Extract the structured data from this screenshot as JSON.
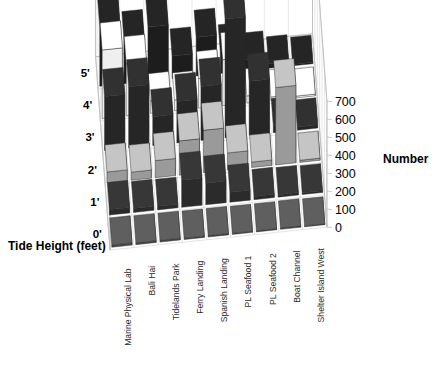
{
  "title": {
    "text": "Number by Site",
    "clipped_at_top": true
  },
  "axes": {
    "value_axis": {
      "label": "Number",
      "ticks": [
        0,
        100,
        200,
        300,
        400,
        500,
        600,
        700
      ],
      "min": 0,
      "max": 700
    },
    "depth_axis": {
      "label": "Tide Height (feet)",
      "categories": [
        "0'",
        "1'",
        "2'",
        "3'",
        "4'",
        "5'"
      ]
    },
    "category_axis": {
      "categories": [
        "Marine Physical Lab",
        "Bali Hai",
        "Tidelands Park",
        "Ferry Landing",
        "Spanish Landing",
        "PL Seafood 1",
        "PL Seafood 2",
        "Boat Channel",
        "Shelter Island West"
      ]
    }
  },
  "colors": {
    "tide_0": "#4a4a4a",
    "tide_1": "#2b2b2b",
    "tide_2": "#9a9a9a",
    "tide_3": "#262626",
    "tide_4": "#efefef",
    "tide_5": "#1d1d1d",
    "background": "#ffffff",
    "wall": "#ffffff",
    "grid": "#d8d8d8",
    "text": "#000000"
  },
  "chart_data": {
    "type": "bar",
    "subtype": "3d-grouped-bar",
    "title": "Number by Site",
    "xlabel": "",
    "ylabel": "Number",
    "zlabel": "Tide Height (feet)",
    "ylim": [
      0,
      700
    ],
    "grid": true,
    "legend": "none",
    "categories": [
      "Marine Physical Lab",
      "Bali Hai",
      "Tidelands Park",
      "Ferry Landing",
      "Spanish Landing",
      "PL Seafood 1",
      "PL Seafood 2",
      "Boat Channel",
      "Shelter Island West"
    ],
    "series": [
      {
        "name": "0'",
        "color": "#4a4a4a",
        "values": [
          12,
          10,
          10,
          8,
          8,
          6,
          6,
          8,
          5
        ]
      },
      {
        "name": "1'",
        "color": "#2b2b2b",
        "values": [
          30,
          22,
          20,
          150,
          120,
          55,
          18,
          14,
          10
        ]
      },
      {
        "name": "2'",
        "color": "#9a9a9a",
        "values": [
          60,
          45,
          95,
          190,
          235,
          95,
          30,
          430,
          12
        ]
      },
      {
        "name": "3'",
        "color": "#262626",
        "values": [
          300,
          340,
          160,
          230,
          300,
          660,
          300,
          40,
          18
        ]
      },
      {
        "name": "4'",
        "color": "#efefef",
        "values": [
          380,
          290,
          70,
          60,
          165,
          255,
          40,
          20,
          10
        ]
      },
      {
        "name": "5'",
        "color": "#1d1d1d",
        "values": [
          330,
          250,
          300,
          125,
          215,
          120,
          60,
          25,
          8
        ]
      }
    ]
  }
}
